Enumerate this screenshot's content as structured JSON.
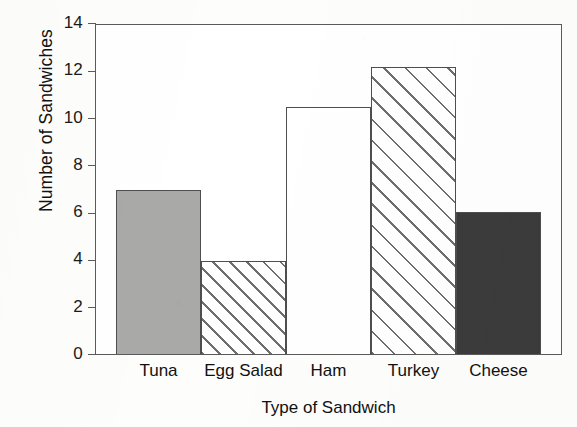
{
  "chart_data": {
    "type": "bar",
    "title": "",
    "xlabel": "Type of Sandwich",
    "ylabel": "Number of Sandwiches",
    "categories": [
      "Tuna",
      "Egg Salad",
      "Ham",
      "Turkey",
      "Cheese"
    ],
    "values": [
      7,
      3.95,
      10.5,
      12.2,
      6.05
    ],
    "ylim": [
      0,
      14
    ],
    "yticks": [
      0,
      2,
      4,
      6,
      8,
      10,
      12,
      14
    ],
    "ytick_labels": [
      "0",
      "2",
      "4",
      "6",
      "8",
      "10",
      "12",
      "14"
    ],
    "grid": false,
    "legend": "none",
    "bar_styles": [
      "solid-gray",
      "hatch-narrow-diagonal",
      "unfilled-white",
      "hatch-wide-diagonal",
      "solid-dark"
    ],
    "colors": {
      "solid_gray": "#a9a9a7",
      "solid_dark": "#3b3b3b",
      "unfilled": "#ffffff",
      "hatch_line": "#6e6e6e",
      "axis": "#5a5a5a",
      "text": "#111111",
      "background": "#fdfdfc"
    }
  }
}
